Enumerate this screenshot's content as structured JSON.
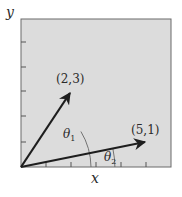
{
  "diagram": {
    "background_color": "#dcdcdc",
    "frame_color": "#6a6a6a",
    "vector_color": "#1e1e1e",
    "arc_color": "#666666",
    "axes": {
      "x_label": "x",
      "y_label": "y",
      "x_ticks": 5,
      "y_ticks": 5
    },
    "vectors": [
      {
        "label": "(2,3)",
        "x": 2,
        "y": 3
      },
      {
        "label": "(5,1)",
        "x": 5,
        "y": 1
      }
    ],
    "angles": [
      {
        "symbol": "θ",
        "subscript": "1",
        "vector": "(2,3)"
      },
      {
        "symbol": "θ",
        "subscript": "2",
        "vector": "(5,1)"
      }
    ]
  }
}
